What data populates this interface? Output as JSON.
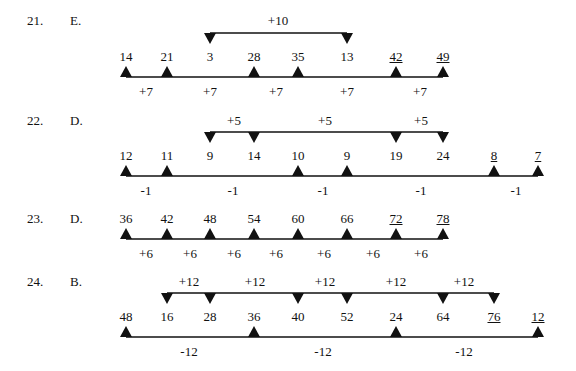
{
  "colors": {
    "ink": "#111111",
    "background": "#ffffff"
  },
  "columns_x": [
    126,
    167,
    210,
    254,
    298,
    347,
    396,
    443,
    494,
    538
  ],
  "problems": [
    {
      "number": "21.",
      "answer": "E.",
      "y_num": 50,
      "y_base": 77,
      "y_top": 33,
      "y_below": 85,
      "y_above": 14,
      "values": [
        {
          "text": "14",
          "col": 0,
          "tri": "up"
        },
        {
          "text": "21",
          "col": 1,
          "tri": "up"
        },
        {
          "text": "3",
          "col": 2,
          "tri": "down"
        },
        {
          "text": "28",
          "col": 3,
          "tri": "up"
        },
        {
          "text": "35",
          "col": 4,
          "tri": "up"
        },
        {
          "text": "13",
          "col": 5,
          "tri": "down"
        },
        {
          "text": "42",
          "col": 6,
          "tri": "up",
          "underline": true
        },
        {
          "text": "49",
          "col": 7,
          "tri": "up",
          "underline": true
        }
      ],
      "base_line": [
        0,
        7
      ],
      "top_line": [
        2,
        5
      ],
      "below_labels": [
        {
          "text": "+7",
          "x": 146
        },
        {
          "text": "+7",
          "x": 210
        },
        {
          "text": "+7",
          "x": 276
        },
        {
          "text": "+7",
          "x": 347
        },
        {
          "text": "+7",
          "x": 420
        }
      ],
      "above_labels": [
        {
          "text": "+10",
          "x": 278
        }
      ]
    },
    {
      "number": "22.",
      "answer": "D.",
      "y_num": 149,
      "y_base": 176,
      "y_top": 132,
      "y_below": 184,
      "y_above": 114,
      "values": [
        {
          "text": "12",
          "col": 0,
          "tri": "up"
        },
        {
          "text": "11",
          "col": 1,
          "tri": "up"
        },
        {
          "text": "9",
          "col": 2,
          "tri": "down"
        },
        {
          "text": "14",
          "col": 3,
          "tri": "down"
        },
        {
          "text": "10",
          "col": 4,
          "tri": "up"
        },
        {
          "text": "9",
          "col": 5,
          "tri": "up"
        },
        {
          "text": "19",
          "col": 6,
          "tri": "down"
        },
        {
          "text": "24",
          "col": 7,
          "tri": "down"
        },
        {
          "text": "8",
          "col": 8,
          "tri": "up",
          "underline": true
        },
        {
          "text": "7",
          "col": 9,
          "tri": "up",
          "underline": true
        }
      ],
      "base_line": [
        0,
        9
      ],
      "top_line": [
        2,
        7
      ],
      "below_labels": [
        {
          "text": "-1",
          "x": 146
        },
        {
          "text": "-1",
          "x": 233
        },
        {
          "text": "-1",
          "x": 323
        },
        {
          "text": "-1",
          "x": 421
        },
        {
          "text": "-1",
          "x": 516
        }
      ],
      "above_labels": [
        {
          "text": "+5",
          "x": 234
        },
        {
          "text": "+5",
          "x": 325
        },
        {
          "text": "+5",
          "x": 421
        }
      ]
    },
    {
      "number": "23.",
      "answer": "D.",
      "y_num": 212,
      "y_base": 239,
      "y_top": null,
      "y_below": 247,
      "y_above": null,
      "values": [
        {
          "text": "36",
          "col": 0,
          "tri": "up"
        },
        {
          "text": "42",
          "col": 1,
          "tri": "up"
        },
        {
          "text": "48",
          "col": 2,
          "tri": "up"
        },
        {
          "text": "54",
          "col": 3,
          "tri": "up"
        },
        {
          "text": "60",
          "col": 4,
          "tri": "up"
        },
        {
          "text": "66",
          "col": 5,
          "tri": "up"
        },
        {
          "text": "72",
          "col": 6,
          "tri": "up",
          "underline": true
        },
        {
          "text": "78",
          "col": 7,
          "tri": "up",
          "underline": true
        }
      ],
      "base_line": [
        0,
        7
      ],
      "top_line": null,
      "below_labels": [
        {
          "text": "+6",
          "x": 146
        },
        {
          "text": "+6",
          "x": 190
        },
        {
          "text": "+6",
          "x": 234
        },
        {
          "text": "+6",
          "x": 276
        },
        {
          "text": "+6",
          "x": 324
        },
        {
          "text": "+6",
          "x": 373
        },
        {
          "text": "+6",
          "x": 421
        }
      ],
      "above_labels": []
    },
    {
      "number": "24.",
      "answer": "B.",
      "y_num": 310,
      "y_base": 337,
      "y_top": 293,
      "y_below": 345,
      "y_above": 275,
      "values": [
        {
          "text": "48",
          "col": 0,
          "tri": "up"
        },
        {
          "text": "16",
          "col": 1,
          "tri": "down"
        },
        {
          "text": "28",
          "col": 2,
          "tri": "down"
        },
        {
          "text": "36",
          "col": 3,
          "tri": "up"
        },
        {
          "text": "40",
          "col": 4,
          "tri": "down"
        },
        {
          "text": "52",
          "col": 5,
          "tri": "down"
        },
        {
          "text": "24",
          "col": 6,
          "tri": "up"
        },
        {
          "text": "64",
          "col": 7,
          "tri": "down"
        },
        {
          "text": "76",
          "col": 8,
          "tri": "down",
          "underline": true
        },
        {
          "text": "12",
          "col": 9,
          "tri": "up",
          "underline": true
        }
      ],
      "base_line": [
        0,
        9
      ],
      "top_line": [
        1,
        8
      ],
      "below_labels": [
        {
          "text": "-12",
          "x": 189
        },
        {
          "text": "-12",
          "x": 323
        },
        {
          "text": "-12",
          "x": 464
        }
      ],
      "above_labels": [
        {
          "text": "+12",
          "x": 189
        },
        {
          "text": "+12",
          "x": 255
        },
        {
          "text": "+12",
          "x": 325
        },
        {
          "text": "+12",
          "x": 396
        },
        {
          "text": "+12",
          "x": 464
        }
      ]
    }
  ],
  "layout": {
    "number_x": 27,
    "answer_x": 70
  }
}
